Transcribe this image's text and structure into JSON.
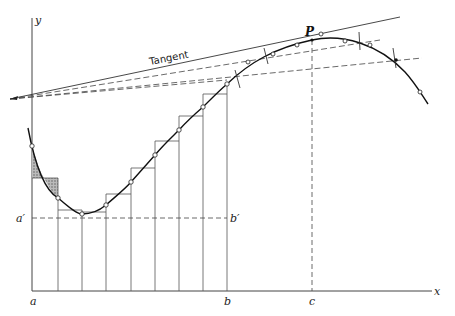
{
  "figure": {
    "labels": {
      "y_axis": "y",
      "x_axis": "x",
      "a": "a",
      "b": "b",
      "c": "c",
      "a_prime": "a′",
      "b_prime": "b′",
      "point": "P",
      "tangent": "Tangent"
    },
    "colors": {
      "line": "#2a2a2a",
      "curve": "#111111",
      "thin": "#555555",
      "hatch": "#777777",
      "background": "#ffffff"
    }
  }
}
